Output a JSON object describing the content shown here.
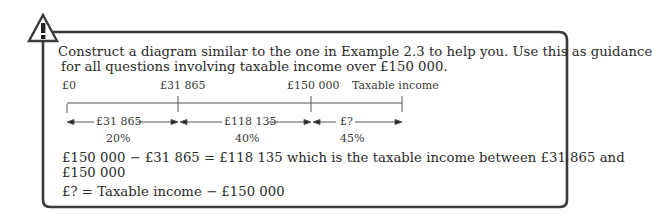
{
  "callout": {
    "icon": "warning-triangle-icon",
    "instruction_line1": "Construct a diagram similar to the one in Example 2.3 to help you. Use this as guidance",
    "instruction_line2": "for all questions involving taxable income over £150 000."
  },
  "diagram": {
    "top_labels": [
      "£0",
      "£31 865",
      "£150 000",
      "Taxable income"
    ],
    "bands": [
      {
        "amount": "£31 865",
        "rate": "20%"
      },
      {
        "amount": "£118 135",
        "rate": "40%"
      },
      {
        "amount": "£?",
        "rate": "45%"
      }
    ]
  },
  "explanation": {
    "line1": "£150 000 − £31 865 = £118 135 which is the taxable income between £31 865 and",
    "line2": "£150 000",
    "line3": "£? = Taxable income − £150 000"
  },
  "colors": {
    "border": "#3a3a3a",
    "text": "#2a2a2a"
  }
}
